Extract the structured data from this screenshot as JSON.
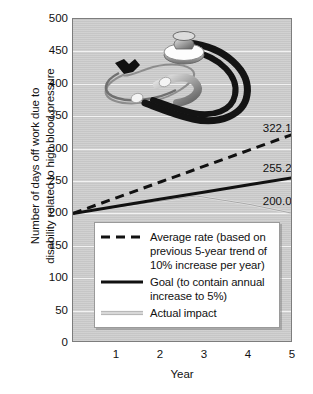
{
  "chart_data": {
    "type": "line",
    "title": "",
    "xlabel": "Year",
    "ylabel_line1": "Number of days off work due to",
    "ylabel_line2": "disability related to high blood pressure",
    "xlim": [
      0,
      5
    ],
    "ylim": [
      0,
      500
    ],
    "xticks": [
      "1",
      "2",
      "3",
      "4",
      "5"
    ],
    "xtick_values": [
      1,
      2,
      3,
      4,
      5
    ],
    "yticks": [
      "0",
      "50",
      "100",
      "150",
      "200",
      "250",
      "300",
      "350",
      "400",
      "450",
      "500"
    ],
    "ytick_values": [
      0,
      50,
      100,
      150,
      200,
      250,
      300,
      350,
      400,
      450,
      500
    ],
    "grid": true,
    "legend_position": "lower-center-left",
    "x": [
      0,
      1,
      2,
      3,
      4,
      5
    ],
    "series": [
      {
        "name": "Average rate (based on previous 5-year trend of 10% increase per year)",
        "style": "dashed",
        "color": "#111111",
        "values": [
          200.0,
          224.42,
          248.84,
          273.26,
          297.68,
          322.1
        ],
        "end_label": "322.10"
      },
      {
        "name": "Goal (to contain annual increase to 5%)",
        "style": "solid",
        "color": "#111111",
        "values": [
          200.0,
          211.05,
          222.1,
          233.15,
          244.2,
          255.25
        ],
        "end_label": "255.25"
      },
      {
        "name": "Actual impact",
        "style": "thin-light",
        "color": "#cfcfcf",
        "values": [
          200.0,
          210.0,
          219.0,
          226.0,
          214.0,
          200.0
        ],
        "peak_x": 2.8,
        "peak_y": 227.0,
        "end_label": "200.00"
      }
    ],
    "annotations": [
      {
        "text": "322.10",
        "x": 4.45,
        "y": 330
      },
      {
        "text": "255.25",
        "x": 4.45,
        "y": 268
      },
      {
        "text": "200.00",
        "x": 4.45,
        "y": 218
      }
    ]
  },
  "legend": {
    "entries": [
      {
        "swatch": "dashed-line",
        "lines": [
          "Average rate (based on",
          "previous 5-year trend of",
          "10% increase per year)"
        ]
      },
      {
        "swatch": "solid-line",
        "lines": [
          "Goal (to contain annual",
          "increase to 5%)"
        ]
      },
      {
        "swatch": "thin-light-line",
        "lines": [
          "Actual impact"
        ]
      }
    ]
  },
  "watermark": {
    "name": "stethoscope-photo"
  },
  "colors": {
    "plot_background": "#cfcfcf",
    "gridline": "#f2f2f2",
    "series_dark": "#111111",
    "series_light": "#cfcfcf",
    "axis": "#7d7d7d",
    "text": "#111111"
  }
}
